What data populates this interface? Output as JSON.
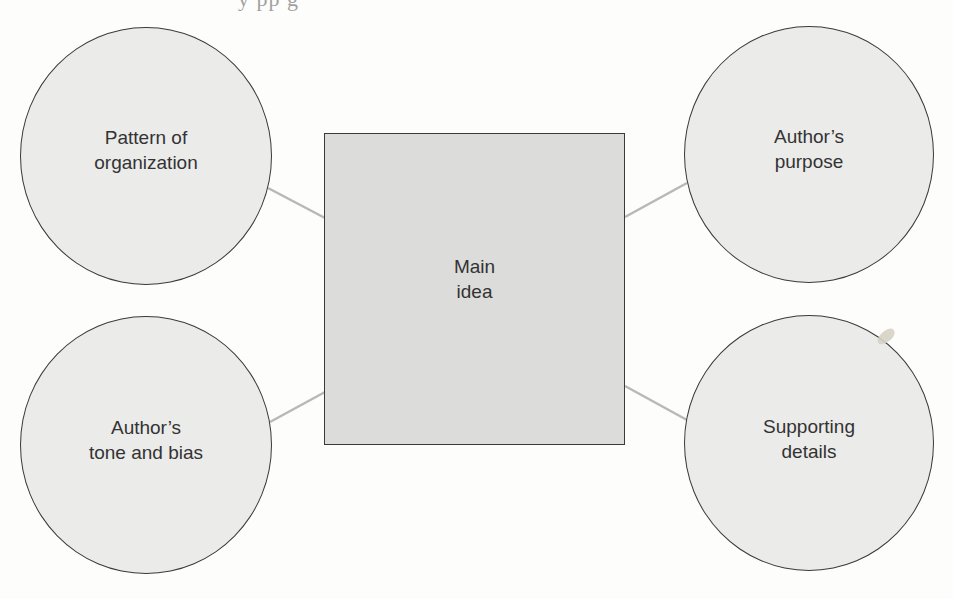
{
  "header": {
    "truncated_text_fragment": "y        pp    g"
  },
  "diagram": {
    "type": "concept-map",
    "center": {
      "id": "main-idea",
      "shape": "square",
      "lines": [
        "Main",
        "idea"
      ],
      "fill": "#dcdcdb",
      "stroke": "#3a3a3a"
    },
    "nodes": [
      {
        "id": "pattern-of-organization",
        "shape": "circle",
        "position": "top-left",
        "lines": [
          "Pattern of",
          "organization"
        ]
      },
      {
        "id": "authors-purpose",
        "shape": "circle",
        "position": "top-right",
        "lines": [
          "Author’s",
          "purpose"
        ]
      },
      {
        "id": "authors-tone-and-bias",
        "shape": "circle",
        "position": "bottom-left",
        "lines": [
          "Author’s",
          "tone and bias"
        ]
      },
      {
        "id": "supporting-details",
        "shape": "circle",
        "position": "bottom-right",
        "lines": [
          "Supporting",
          "details"
        ]
      }
    ],
    "edges": [
      {
        "from": "pattern-of-organization",
        "to": "main-idea"
      },
      {
        "from": "authors-purpose",
        "to": "main-idea"
      },
      {
        "from": "authors-tone-and-bias",
        "to": "main-idea"
      },
      {
        "from": "supporting-details",
        "to": "main-idea"
      }
    ],
    "colors": {
      "circle_fill": "#ebebea",
      "square_fill": "#dcdcdb",
      "outline": "#3a3a3a",
      "connector": "#b8b8b8",
      "text": "#333333",
      "background": "#fdfdfc"
    }
  }
}
